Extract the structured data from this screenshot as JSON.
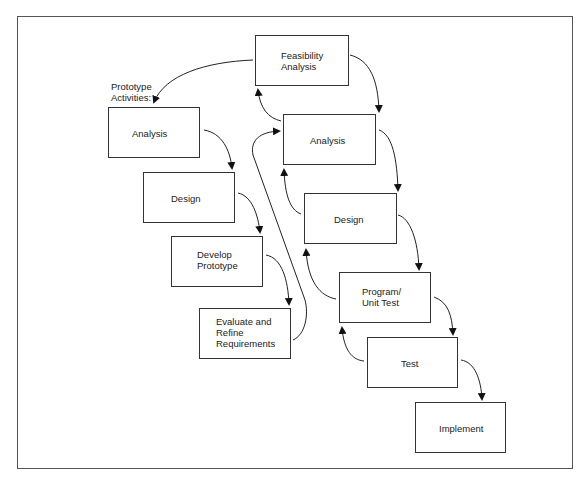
{
  "diagram": {
    "type": "prototyping-waterfall-flow",
    "note_label": "Prototype\nActivities:",
    "main_phases": [
      {
        "id": "feasibility",
        "label": "Feasibility\nAnalysis"
      },
      {
        "id": "analysis",
        "label": "Analysis"
      },
      {
        "id": "design",
        "label": "Design"
      },
      {
        "id": "program",
        "label": "Program/\nUnit Test"
      },
      {
        "id": "test",
        "label": "Test"
      },
      {
        "id": "implement",
        "label": "Implement"
      }
    ],
    "prototype_activities": [
      {
        "id": "p_analysis",
        "label": "Analysis"
      },
      {
        "id": "p_design",
        "label": "Design"
      },
      {
        "id": "p_develop",
        "label": "Develop\nPrototype"
      },
      {
        "id": "p_evaluate",
        "label": "Evaluate and\nRefine\nRequirements"
      }
    ],
    "edges": [
      {
        "from": "feasibility",
        "to": "analysis"
      },
      {
        "from": "analysis",
        "to": "design"
      },
      {
        "from": "design",
        "to": "program"
      },
      {
        "from": "program",
        "to": "test"
      },
      {
        "from": "test",
        "to": "implement"
      },
      {
        "from": "analysis",
        "to": "feasibility",
        "kind": "feedback"
      },
      {
        "from": "design",
        "to": "analysis",
        "kind": "feedback"
      },
      {
        "from": "program",
        "to": "design",
        "kind": "feedback"
      },
      {
        "from": "test",
        "to": "program",
        "kind": "feedback"
      },
      {
        "from": "feasibility",
        "to": "p_analysis"
      },
      {
        "from": "p_analysis",
        "to": "p_design"
      },
      {
        "from": "p_design",
        "to": "p_develop"
      },
      {
        "from": "p_develop",
        "to": "p_evaluate"
      },
      {
        "from": "p_evaluate",
        "to": "analysis"
      }
    ]
  }
}
